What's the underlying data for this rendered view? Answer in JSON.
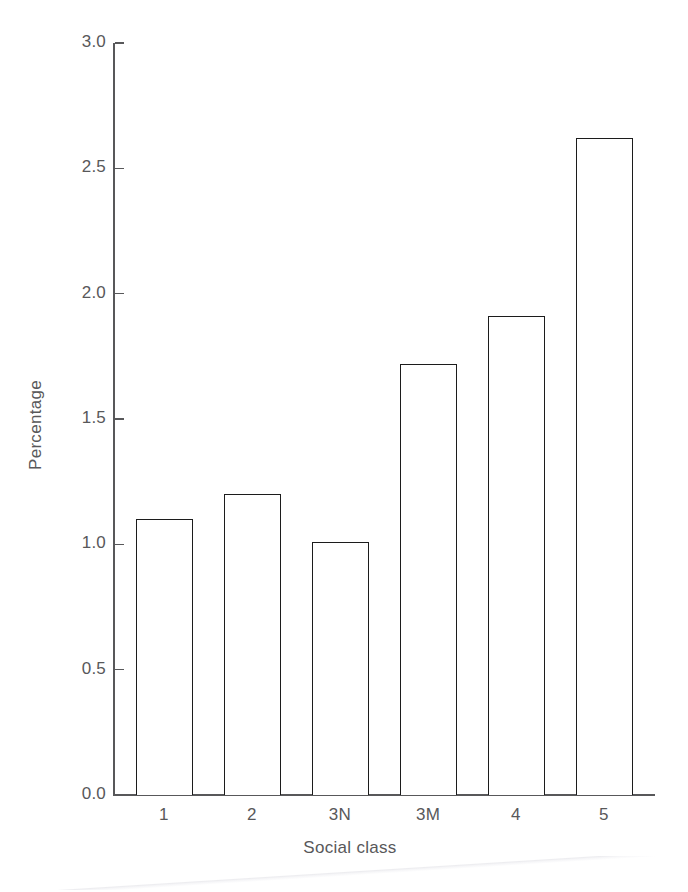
{
  "chart_data": {
    "type": "bar",
    "title": "",
    "subtitle": "",
    "xlabel": "Social class",
    "ylabel": "Percentage",
    "categories": [
      "1",
      "2",
      "3N",
      "3M",
      "4",
      "5"
    ],
    "values": [
      1.1,
      1.2,
      1.01,
      1.72,
      1.91,
      2.62
    ],
    "series": [
      {
        "name": "Percentage",
        "values": [
          1.1,
          1.2,
          1.01,
          1.72,
          1.91,
          2.62
        ]
      }
    ],
    "ylim": [
      0.0,
      3.0
    ],
    "ytick_labels": [
      "0.0",
      "0.5",
      "1.0",
      "1.5",
      "2.0",
      "2.5",
      "3.0"
    ],
    "ytick_values": [
      0.0,
      0.5,
      1.0,
      1.5,
      2.0,
      2.5,
      3.0
    ],
    "xtick_labels": [
      "1",
      "2",
      "3N",
      "3M",
      "4",
      "5"
    ],
    "grid": false,
    "legend": false,
    "legend_position": "none",
    "bar_fill_color": "#ffffff",
    "bar_edge_color": "#1c1c1c",
    "axis_color": "#58585a",
    "text_color": "#58585a",
    "background_color": "#ffffff",
    "annotations": []
  }
}
